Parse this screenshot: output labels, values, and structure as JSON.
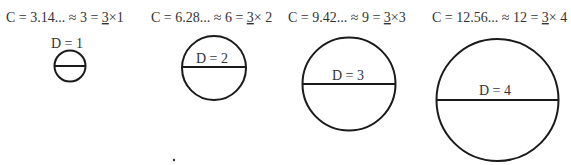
{
  "diagram": {
    "items": [
      {
        "formula_prefix": "C = 3.14... ≈ 3 = ",
        "multiplier": "3",
        "formula_suffix": "×1",
        "diameter_label": "D = 1",
        "diameter": 1,
        "circumference": "3.14...",
        "approx": 3
      },
      {
        "formula_prefix": "C = 6.28... ≈ 6 = ",
        "multiplier": "3",
        "formula_suffix": "× 2",
        "diameter_label": "D = 2",
        "diameter": 2,
        "circumference": "6.28...",
        "approx": 6
      },
      {
        "formula_prefix": "C = 9.42... ≈ 9 = ",
        "multiplier": "3",
        "formula_suffix": "×3",
        "diameter_label": "D = 3",
        "diameter": 3,
        "circumference": "9.42...",
        "approx": 9
      },
      {
        "formula_prefix": "C = 12.56... ≈ 12 = ",
        "multiplier": "3",
        "formula_suffix": "× 4",
        "diameter_label": "D = 4",
        "diameter": 4,
        "circumference": "12.56...",
        "approx": 12
      }
    ],
    "colors": {
      "stroke": "#1a1a1a",
      "text": "#333333",
      "background": "#ffffff"
    }
  }
}
